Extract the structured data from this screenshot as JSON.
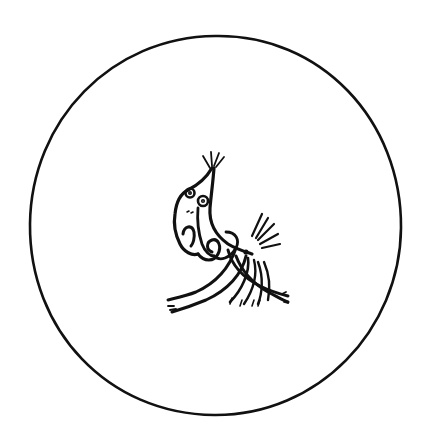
{
  "illustration": {
    "description": "Hand-drawn black ink sketch inside a large circle: a stylized creature with a pointed tuft-tipped snout and round eyes, its body curling into a spiral, with crossing flowing strands below and a small spray of lines to the right.",
    "colors": {
      "background": "#ffffff",
      "ink": "#111111"
    }
  }
}
